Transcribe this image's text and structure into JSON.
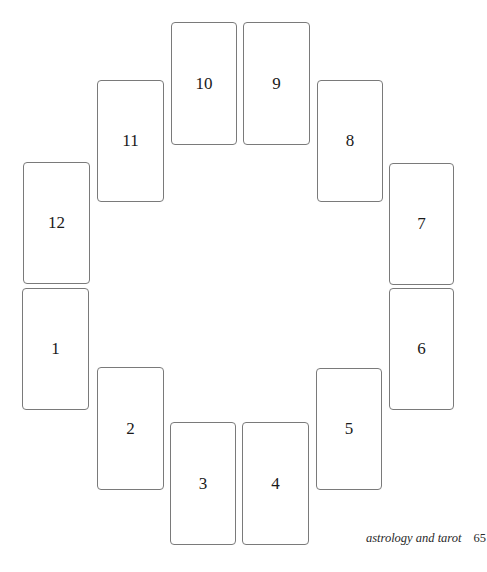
{
  "spread": {
    "name": "twelve-house astrological spread",
    "cards": [
      {
        "label": "1",
        "x": 22,
        "y": 288,
        "w": 67,
        "h": 122
      },
      {
        "label": "2",
        "x": 97,
        "y": 367,
        "w": 67,
        "h": 123
      },
      {
        "label": "3",
        "x": 170,
        "y": 422,
        "w": 66,
        "h": 123
      },
      {
        "label": "4",
        "x": 242,
        "y": 422,
        "w": 67,
        "h": 123
      },
      {
        "label": "5",
        "x": 316,
        "y": 368,
        "w": 66,
        "h": 122
      },
      {
        "label": "6",
        "x": 389,
        "y": 288,
        "w": 65,
        "h": 122
      },
      {
        "label": "7",
        "x": 389,
        "y": 163,
        "w": 65,
        "h": 122
      },
      {
        "label": "8",
        "x": 317,
        "y": 80,
        "w": 66,
        "h": 122
      },
      {
        "label": "9",
        "x": 243,
        "y": 22,
        "w": 67,
        "h": 123
      },
      {
        "label": "10",
        "x": 171,
        "y": 22,
        "w": 66,
        "h": 123
      },
      {
        "label": "11",
        "x": 97,
        "y": 80,
        "w": 67,
        "h": 122
      },
      {
        "label": "12",
        "x": 23,
        "y": 162,
        "w": 67,
        "h": 122
      }
    ]
  },
  "footer": {
    "running_title": "astrology and tarot",
    "page_number": "65"
  },
  "colors": {
    "card_border": "#7a7a7a",
    "text": "#1a1a1a",
    "background": "#ffffff"
  }
}
